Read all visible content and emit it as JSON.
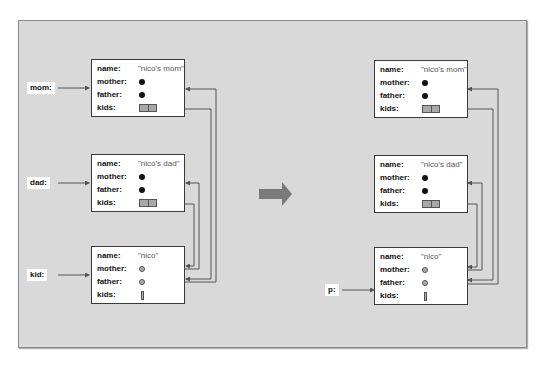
{
  "diagram": {
    "left": {
      "variables": [
        {
          "label": "mom:"
        },
        {
          "label": "dad:"
        },
        {
          "label": "kid:"
        }
      ],
      "objects": [
        {
          "name_label": "name:",
          "name_value": "\"nico's mom\"",
          "mother_label": "mother:",
          "father_label": "father:",
          "kids_label": "kids:"
        },
        {
          "name_label": "name:",
          "name_value": "\"nico's dad\"",
          "mother_label": "mother:",
          "father_label": "father:",
          "kids_label": "kids:"
        },
        {
          "name_label": "name:",
          "name_value": "\"nico\"",
          "mother_label": "mother:",
          "father_label": "father:",
          "kids_label": "kids:"
        }
      ]
    },
    "right": {
      "variables": [
        {
          "label": "p:"
        }
      ],
      "objects": [
        {
          "name_label": "name:",
          "name_value": "\"nico's mom\"",
          "mother_label": "mother:",
          "father_label": "father:",
          "kids_label": "kids:"
        },
        {
          "name_label": "name:",
          "name_value": "\"nico's dad\"",
          "mother_label": "mother:",
          "father_label": "father:",
          "kids_label": "kids:"
        },
        {
          "name_label": "name:",
          "name_value": "\"nico\"",
          "mother_label": "mother:",
          "father_label": "father:",
          "kids_label": "kids:"
        }
      ]
    },
    "transition_arrow": "right-arrow-icon",
    "colors": {
      "panel_bg": "#d9d9d9",
      "box_bg": "#ffffff",
      "line": "#555555",
      "arrow": "#7a7a7a",
      "null_dot": "#111111",
      "pointer_dot": "#aaaaaa"
    }
  }
}
